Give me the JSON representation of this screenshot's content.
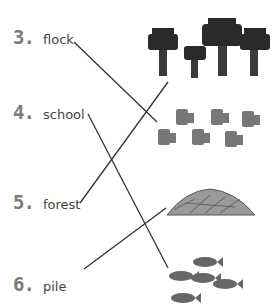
{
  "items": [
    {
      "number": "3.",
      "word": "flock"
    },
    {
      "number": "4.",
      "word": "school"
    },
    {
      "number": "5.",
      "word": "forest"
    },
    {
      "number": "6.",
      "word": "pile"
    }
  ],
  "pictures": [
    {
      "name": "trees-group",
      "description": "group of 4 dark trees"
    },
    {
      "name": "birds-group",
      "description": "group of 7 birds"
    },
    {
      "name": "log-pile",
      "description": "pile of logs"
    },
    {
      "name": "fish-group",
      "description": "group of 5 fish"
    }
  ],
  "matches": [
    {
      "from": "flock",
      "to": "birds-group"
    },
    {
      "from": "school",
      "to": "fish-group"
    },
    {
      "from": "forest",
      "to": "trees-group"
    },
    {
      "from": "pile",
      "to": "log-pile"
    }
  ],
  "colors": {
    "number": "#7a7a7a",
    "text": "#444444",
    "line": "#333333"
  }
}
